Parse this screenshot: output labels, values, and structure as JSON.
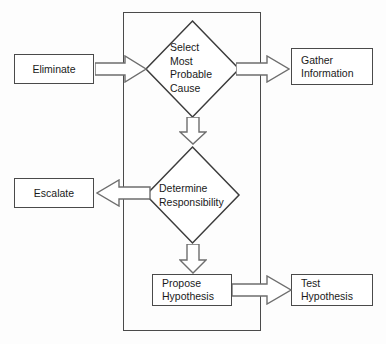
{
  "diagram": {
    "canvas": {
      "width": 386,
      "height": 344,
      "background": "#fdfdfd"
    },
    "colors": {
      "stroke": "#4a4a4a",
      "shape_fill": "#ffffff",
      "text": "#1a1a1a",
      "arrow_fill": "#ffffff",
      "arrow_stroke": "#6e6e6e"
    },
    "container": {
      "name": "process-boundary",
      "label": ""
    },
    "nodes": [
      {
        "id": "eliminate",
        "shape": "rectangle",
        "label": "Eliminate"
      },
      {
        "id": "select_most_probable_cause",
        "shape": "diamond",
        "label": "Select\nMost\nProbable\nCause"
      },
      {
        "id": "gather_information",
        "shape": "rectangle",
        "label": "Gather\nInformation"
      },
      {
        "id": "determine_responsibility",
        "shape": "diamond",
        "label": "Determine\nResponsibility"
      },
      {
        "id": "escalate",
        "shape": "rectangle",
        "label": "Escalate"
      },
      {
        "id": "propose_hypothesis",
        "shape": "rectangle",
        "label": "Propose\nHypothesis"
      },
      {
        "id": "test_hypothesis",
        "shape": "rectangle",
        "label": "Test Hypothesis"
      }
    ],
    "edges": [
      {
        "id": "e1",
        "from": "eliminate",
        "to": "select_most_probable_cause",
        "direction": "right",
        "label": ""
      },
      {
        "id": "e2",
        "from": "select_most_probable_cause",
        "to": "gather_information",
        "direction": "right",
        "label": ""
      },
      {
        "id": "e3",
        "from": "select_most_probable_cause",
        "to": "determine_responsibility",
        "direction": "down",
        "label": ""
      },
      {
        "id": "e4",
        "from": "determine_responsibility",
        "to": "escalate",
        "direction": "left",
        "label": ""
      },
      {
        "id": "e5",
        "from": "determine_responsibility",
        "to": "propose_hypothesis",
        "direction": "down",
        "label": ""
      },
      {
        "id": "e6",
        "from": "propose_hypothesis",
        "to": "test_hypothesis",
        "direction": "right",
        "label": ""
      }
    ]
  }
}
